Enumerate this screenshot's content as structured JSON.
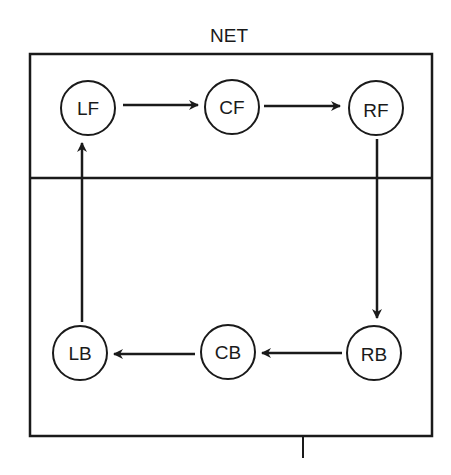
{
  "diagram": {
    "title": "NET",
    "colors": {
      "line": "#1a1a1a",
      "background": "#ffffff"
    },
    "regions": [
      {
        "id": "front",
        "label": ""
      },
      {
        "id": "back",
        "label": ""
      }
    ],
    "nodes": [
      {
        "id": "LF",
        "label": "LF",
        "x": 88,
        "y": 108
      },
      {
        "id": "CF",
        "label": "CF",
        "x": 232,
        "y": 107
      },
      {
        "id": "RF",
        "label": "RF",
        "x": 376,
        "y": 109
      },
      {
        "id": "RB",
        "label": "RB",
        "x": 374,
        "y": 353
      },
      {
        "id": "CB",
        "label": "CB",
        "x": 228,
        "y": 352
      },
      {
        "id": "LB",
        "label": "LB",
        "x": 80,
        "y": 353
      }
    ],
    "edges": [
      {
        "from": "LF",
        "to": "CF"
      },
      {
        "from": "CF",
        "to": "RF"
      },
      {
        "from": "RF",
        "to": "RB"
      },
      {
        "from": "RB",
        "to": "CB"
      },
      {
        "from": "CB",
        "to": "LB"
      },
      {
        "from": "LB",
        "to": "LF"
      }
    ]
  }
}
